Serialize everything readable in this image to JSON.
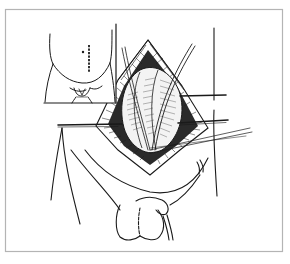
{
  "figure": {
    "type": "surgical-line-illustration",
    "caption": "",
    "colors": {
      "background": "#ffffff",
      "frame": "#b4b4b4",
      "ink": "#1a1a1a",
      "shading": "#3a3a3a"
    },
    "frame": {
      "x": 5,
      "y": 9,
      "width": 278,
      "height": 243
    },
    "inset": {
      "label": "",
      "description": "lower abdomen with dashed incision marker",
      "box": {
        "x": 44,
        "y": 23,
        "width": 72,
        "height": 80
      }
    },
    "main_view": {
      "description": "open incision with retractors and sutures"
    }
  }
}
